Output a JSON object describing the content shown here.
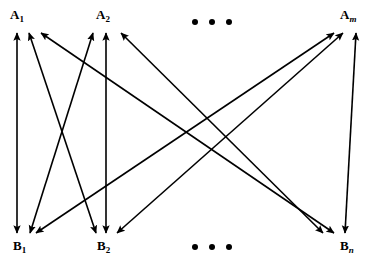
{
  "diagram": {
    "background_color": "#ffffff",
    "line_color": "#000000",
    "line_width": 1.6,
    "nodes": {
      "top_row": [
        {
          "id": "A1",
          "base": "A",
          "subscript": "1",
          "subscript_italic": false,
          "label_x": 10,
          "label_y": 8,
          "anchor_x": 22,
          "anchor_y": 32
        },
        {
          "id": "A2",
          "base": "A",
          "subscript": "2",
          "subscript_italic": false,
          "label_x": 96,
          "label_y": 8,
          "anchor_x": 104,
          "anchor_y": 32
        },
        {
          "id": "Am",
          "base": "A",
          "subscript": "m",
          "subscript_italic": true,
          "label_x": 340,
          "label_y": 8,
          "anchor_x": 350,
          "anchor_y": 32
        }
      ],
      "bottom_row": [
        {
          "id": "B1",
          "base": "B",
          "subscript": "1",
          "subscript_italic": false,
          "label_x": 13,
          "label_y": 239,
          "anchor_x": 24,
          "anchor_y": 234
        },
        {
          "id": "B2",
          "base": "B",
          "subscript": "2",
          "subscript_italic": false,
          "label_x": 97,
          "label_y": 239,
          "anchor_x": 106,
          "anchor_y": 234
        },
        {
          "id": "Bn",
          "base": "B",
          "subscript": "n",
          "subscript_italic": true,
          "label_x": 340,
          "label_y": 239,
          "anchor_x": 345,
          "anchor_y": 234
        }
      ]
    },
    "ellipses": [
      {
        "name": "top-ellipsis",
        "x": 192,
        "y": 19,
        "dots": 3
      },
      {
        "name": "bottom-ellipsis",
        "x": 192,
        "y": 244,
        "dots": 3
      }
    ],
    "edges": [
      {
        "id": "A1-B1",
        "from": "A1",
        "to": "B1",
        "x1": 17,
        "y1": 33,
        "x2": 17,
        "y2": 233,
        "double_headed": true
      },
      {
        "id": "A2-B2",
        "from": "A2",
        "to": "B2",
        "x1": 106,
        "y1": 33,
        "x2": 106,
        "y2": 233,
        "double_headed": true
      },
      {
        "id": "Am-Bn",
        "from": "Am",
        "to": "Bn",
        "x1": 356,
        "y1": 33,
        "x2": 345,
        "y2": 233,
        "double_headed": true
      },
      {
        "id": "A1-B2",
        "from": "A1",
        "to": "B2",
        "x1": 29,
        "y1": 33,
        "x2": 96,
        "y2": 233,
        "double_headed": true
      },
      {
        "id": "A2-B1",
        "from": "A2",
        "to": "B1",
        "x1": 93,
        "y1": 33,
        "x2": 30,
        "y2": 233,
        "double_headed": true
      },
      {
        "id": "A1-Bn",
        "from": "A1",
        "to": "Bn",
        "x1": 41,
        "y1": 33,
        "x2": 334,
        "y2": 233,
        "double_headed": true
      },
      {
        "id": "Am-B1",
        "from": "Am",
        "to": "B1",
        "x1": 334,
        "y1": 33,
        "x2": 36,
        "y2": 233,
        "double_headed": true
      },
      {
        "id": "A2-Bn",
        "from": "A2",
        "to": "Bn",
        "x1": 121,
        "y1": 33,
        "x2": 323,
        "y2": 233,
        "double_headed": true
      },
      {
        "id": "Am-B2",
        "from": "Am",
        "to": "B2",
        "x1": 343,
        "y1": 33,
        "x2": 117,
        "y2": 233,
        "double_headed": true
      }
    ]
  }
}
